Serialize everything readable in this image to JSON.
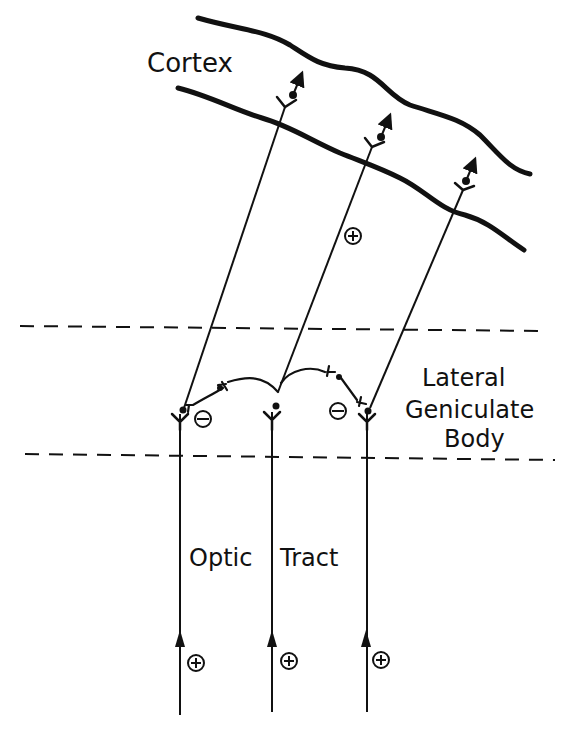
{
  "diagram": {
    "labels": {
      "cortex": "Cortex",
      "lgn_line1": "Lateral",
      "lgn_line2": "Geniculate",
      "lgn_line3": "Body",
      "optic": "Optic",
      "tract": "Tract"
    },
    "signs": {
      "plus": "+",
      "minus": "−"
    },
    "colors": {
      "ink": "#111111",
      "background": "#ffffff"
    }
  }
}
